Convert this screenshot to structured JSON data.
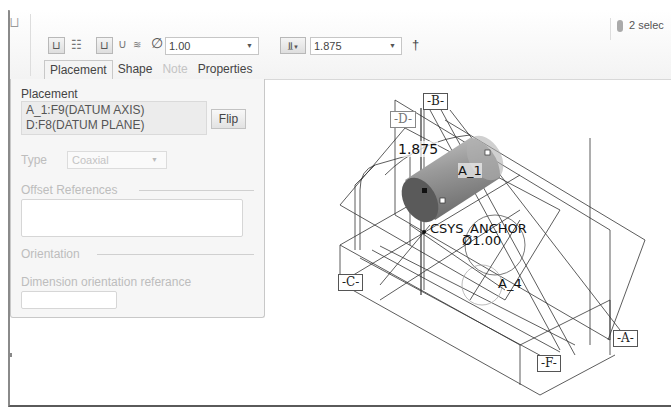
{
  "toolbar": {
    "diameter_value": "1.00",
    "depth_value": "1.875",
    "status_text": "2 selec"
  },
  "tabs": [
    {
      "label": "Placement",
      "state": "active"
    },
    {
      "label": "Shape",
      "state": "normal"
    },
    {
      "label": "Note",
      "state": "disabled"
    },
    {
      "label": "Properties",
      "state": "normal"
    }
  ],
  "panel": {
    "placement_label": "Placement",
    "references": [
      "A_1:F9(DATUM AXIS)",
      "D:F8(DATUM PLANE)"
    ],
    "flip_label": "Flip",
    "type_label": "Type",
    "type_value": "Coaxial",
    "offset_label": "Offset References",
    "orientation_label": "Orientation",
    "dim_orient_label": "Dimension orientation referance"
  },
  "model": {
    "datums": {
      "a": "A",
      "b": "B",
      "c": "C",
      "d": "D",
      "f": "F"
    },
    "axis_a1": "A_1",
    "axis_a4": "A_4",
    "depth_dim": "1.875",
    "csys": "CSYS_ANCHOR",
    "diameter_dim": "Ø1.00"
  }
}
